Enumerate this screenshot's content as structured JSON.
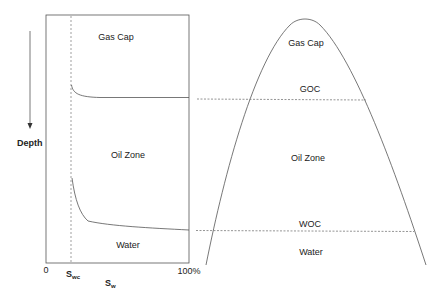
{
  "left_panel": {
    "zones": {
      "gas_cap": "Gas Cap",
      "oil_zone": "Oil Zone",
      "water": "Water"
    },
    "depth_label": "Depth",
    "x_axis": {
      "origin": "0",
      "swc_main": "S",
      "swc_sub": "wc",
      "max": "100%",
      "title_main": "S",
      "title_sub": "w"
    }
  },
  "right_panel": {
    "zones": {
      "gas_cap": "Gas Cap",
      "goc": "GOC",
      "oil_zone": "Oil Zone",
      "woc": "WOC",
      "water": "Water"
    }
  },
  "colors": {
    "line": "#555555",
    "text": "#222222"
  }
}
